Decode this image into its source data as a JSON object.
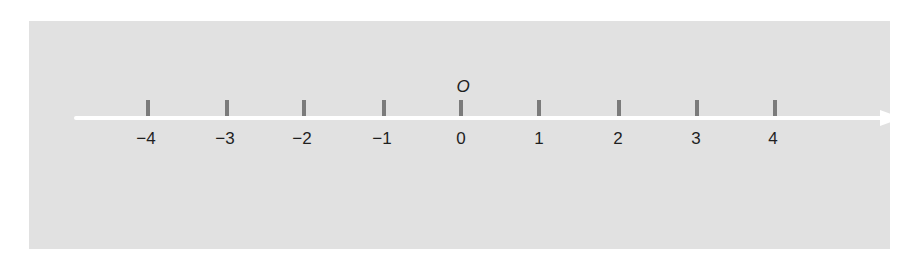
{
  "diagram": {
    "type": "number-line",
    "origin_label": "O",
    "ticks": [
      {
        "value": -4,
        "label": "−4"
      },
      {
        "value": -3,
        "label": "−3"
      },
      {
        "value": -2,
        "label": "−2"
      },
      {
        "value": -1,
        "label": "−1"
      },
      {
        "value": 0,
        "label": "0"
      },
      {
        "value": 1,
        "label": "1"
      },
      {
        "value": 2,
        "label": "2"
      },
      {
        "value": 3,
        "label": "3"
      },
      {
        "value": 4,
        "label": "4"
      }
    ],
    "direction": "positive-right",
    "colors": {
      "background": "#e1e1e1",
      "line": "#ffffff",
      "tick": "#7b7b7b",
      "text": "#1f1f1f"
    }
  }
}
